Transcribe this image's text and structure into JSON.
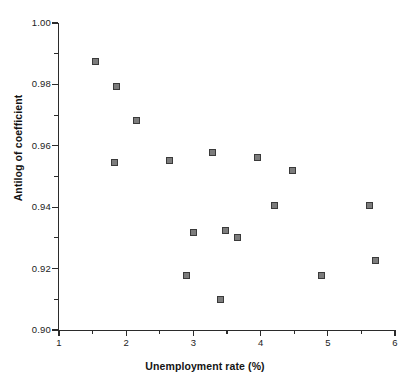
{
  "chart_data": {
    "type": "scatter",
    "title": "",
    "xlabel": "Unemployment rate (%)",
    "ylabel": "Antilog of coefficient",
    "xlim": [
      1,
      6
    ],
    "ylim": [
      0.9,
      1.0
    ],
    "grid": false,
    "legend": null,
    "x_ticks": [
      {
        "value": 1,
        "label": "1",
        "minor": false
      },
      {
        "value": 1.5,
        "label": "",
        "minor": true
      },
      {
        "value": 2,
        "label": "2",
        "minor": false
      },
      {
        "value": 2.5,
        "label": "",
        "minor": true
      },
      {
        "value": 3,
        "label": "3",
        "minor": false
      },
      {
        "value": 3.5,
        "label": "",
        "minor": true
      },
      {
        "value": 4,
        "label": "4",
        "minor": false
      },
      {
        "value": 4.5,
        "label": "",
        "minor": true
      },
      {
        "value": 5,
        "label": "5",
        "minor": false
      },
      {
        "value": 5.5,
        "label": "",
        "minor": true
      },
      {
        "value": 6,
        "label": "6",
        "minor": false
      }
    ],
    "y_ticks": [
      {
        "value": 1.0,
        "label": "1.00",
        "minor": false
      },
      {
        "value": 0.99,
        "label": "",
        "minor": true
      },
      {
        "value": 0.98,
        "label": "0.98",
        "minor": false
      },
      {
        "value": 0.97,
        "label": "",
        "minor": true
      },
      {
        "value": 0.96,
        "label": "0.96",
        "minor": false
      },
      {
        "value": 0.95,
        "label": "",
        "minor": true
      },
      {
        "value": 0.94,
        "label": "0.94",
        "minor": false
      },
      {
        "value": 0.93,
        "label": "",
        "minor": true
      },
      {
        "value": 0.92,
        "label": "0.92",
        "minor": false
      },
      {
        "value": 0.91,
        "label": "",
        "minor": true
      },
      {
        "value": 0.9,
        "label": "0.90",
        "minor": false
      }
    ],
    "marker": {
      "shape": "square",
      "fill_color": "#7c7c7c",
      "edge_color": "#3a3a3a",
      "size_px": 7
    },
    "series": [
      {
        "name": "observations",
        "points": [
          {
            "x": 1.54,
            "y": 0.9873
          },
          {
            "x": 1.85,
            "y": 0.9792
          },
          {
            "x": 2.15,
            "y": 0.9684
          },
          {
            "x": 1.82,
            "y": 0.9547
          },
          {
            "x": 2.64,
            "y": 0.9551
          },
          {
            "x": 3.29,
            "y": 0.9577
          },
          {
            "x": 3.96,
            "y": 0.9561
          },
          {
            "x": 4.48,
            "y": 0.9521
          },
          {
            "x": 4.21,
            "y": 0.9404
          },
          {
            "x": 5.62,
            "y": 0.9404
          },
          {
            "x": 3.0,
            "y": 0.9319
          },
          {
            "x": 3.48,
            "y": 0.9325
          },
          {
            "x": 3.66,
            "y": 0.93
          },
          {
            "x": 5.71,
            "y": 0.9225
          },
          {
            "x": 2.9,
            "y": 0.9179
          },
          {
            "x": 4.91,
            "y": 0.9179
          },
          {
            "x": 3.41,
            "y": 0.91
          }
        ]
      }
    ]
  }
}
